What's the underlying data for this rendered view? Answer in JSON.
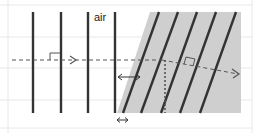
{
  "diagram": {
    "labels": {
      "medium_top": "air"
    },
    "colors": {
      "background": "#ffffff",
      "grid": "#e6e6e6",
      "medium": "#cfcfcf",
      "wavefront": "#333333",
      "ray": "#555555"
    },
    "wavefronts_air_x": [
      33,
      61,
      88,
      115
    ],
    "wavefronts_medium": [
      {
        "top_x": 159,
        "bottom_x": 123
      },
      {
        "top_x": 178,
        "bottom_x": 141
      },
      {
        "top_x": 197,
        "bottom_x": 161
      },
      {
        "top_x": 216,
        "bottom_x": 180
      },
      {
        "top_x": 236,
        "bottom_x": 200
      }
    ],
    "annotations": [
      "incident ray (dashed arrow)",
      "refracted ray (dashed arrow)",
      "right-angle marker on incident ray",
      "right-angle marker on refracted ray",
      "wavelength in air (double arrow)",
      "wavelength in medium (double arrow)",
      "normal (dotted line)"
    ]
  }
}
